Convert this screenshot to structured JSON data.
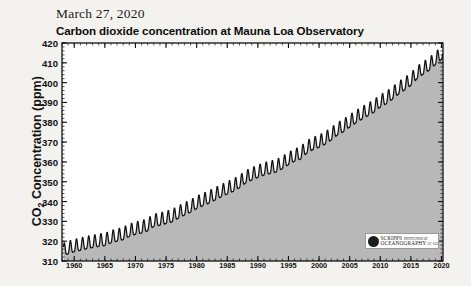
{
  "page": {
    "date_header": "March 27, 2020",
    "background_color": "#f3f2ef"
  },
  "chart_data": {
    "type": "line",
    "title": "Carbon dioxide concentration at Mauna Loa Observatory",
    "subtitle": "",
    "annotation": "Full Record ending March 27, 2020",
    "xlabel": "",
    "ylabel": "CO2 Concentration (ppm)",
    "ylabel_parts": {
      "pre": "CO",
      "sub": "2",
      "post": " Concentration (ppm)"
    },
    "xlim": [
      1958,
      2020.25
    ],
    "ylim": [
      310,
      420
    ],
    "ytick_labels": [
      "420",
      "410",
      "400",
      "390",
      "380",
      "370",
      "360",
      "350",
      "340",
      "330",
      "320",
      "310"
    ],
    "ytick_values": [
      420,
      410,
      400,
      390,
      380,
      370,
      360,
      350,
      340,
      330,
      320,
      310
    ],
    "y_minor_step": 2,
    "xtick_labels": [
      "1960",
      "1965",
      "1970",
      "1975",
      "1980",
      "1985",
      "1990",
      "1995",
      "2000",
      "2005",
      "2010",
      "2015",
      "2020"
    ],
    "xtick_values": [
      1960,
      1965,
      1970,
      1975,
      1980,
      1985,
      1990,
      1995,
      2000,
      2005,
      2010,
      2015,
      2020
    ],
    "x_minor_step": 1,
    "grid": false,
    "legend": null,
    "fill_below": true,
    "fill_color": "#b8b8b8",
    "line_color": "#111111",
    "seasonal_amplitude_ppm": 3.2,
    "series": [
      {
        "name": "Monthly mean CO2 (Keeling Curve)",
        "x": [
          1958.25,
          1959,
          1960,
          1961,
          1962,
          1963,
          1964,
          1965,
          1966,
          1967,
          1968,
          1969,
          1970,
          1971,
          1972,
          1973,
          1974,
          1975,
          1976,
          1977,
          1978,
          1979,
          1980,
          1981,
          1982,
          1983,
          1984,
          1985,
          1986,
          1987,
          1988,
          1989,
          1990,
          1991,
          1992,
          1993,
          1994,
          1995,
          1996,
          1997,
          1998,
          1999,
          2000,
          2001,
          2002,
          2003,
          2004,
          2005,
          2006,
          2007,
          2008,
          2009,
          2010,
          2011,
          2012,
          2013,
          2014,
          2015,
          2016,
          2017,
          2018,
          2019,
          2020.23
        ],
        "values": [
          315.0,
          315.9,
          316.9,
          317.6,
          318.4,
          319.0,
          319.6,
          320.0,
          321.4,
          322.2,
          323.0,
          324.6,
          325.7,
          326.3,
          327.5,
          329.7,
          330.2,
          331.1,
          332.0,
          333.8,
          335.4,
          336.8,
          338.7,
          340.1,
          341.4,
          343.0,
          344.6,
          346.0,
          347.4,
          349.2,
          351.6,
          353.1,
          354.4,
          355.6,
          356.4,
          357.1,
          358.8,
          360.8,
          362.6,
          363.7,
          366.7,
          368.4,
          369.6,
          371.2,
          373.3,
          375.8,
          377.5,
          379.8,
          381.9,
          383.8,
          385.6,
          387.4,
          389.9,
          391.6,
          393.9,
          396.5,
          398.6,
          400.8,
          404.2,
          406.5,
          408.5,
          411.4,
          414.5
        ]
      }
    ]
  },
  "logo": {
    "name": "scripps-institution-of-oceanography-logo",
    "line1": "SCRIPPS",
    "line1_sub": "INSTITUTION OF",
    "line2": "OCEANOGRAPHY",
    "line2_sub": "UC SAN DIEGO"
  }
}
